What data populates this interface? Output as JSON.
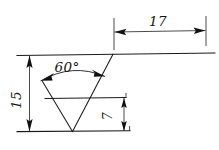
{
  "drawing": {
    "title": "Dimensioned V-groove profile sketch",
    "background_color": "#ffffff",
    "line_color": "#1a1a1a",
    "dimension_color": "#2b2b2b",
    "text_color": "#141414",
    "units_note": "",
    "dimensions": [
      {
        "id": "width-17",
        "label": "17",
        "value": 17,
        "orientation": "horizontal",
        "text_rotation_deg": 0,
        "arrow_style": "filled-inward",
        "position": "top"
      },
      {
        "id": "angle-60",
        "label": "60°",
        "value": 60,
        "orientation": "angular",
        "text_rotation_deg": 0,
        "arrow_style": "filled-arc-ends",
        "position": "inside-vee"
      },
      {
        "id": "height-15",
        "label": "15",
        "value": 15,
        "orientation": "vertical",
        "text_rotation_deg": -90,
        "arrow_style": "filled-inward",
        "position": "left"
      },
      {
        "id": "height-7",
        "label": "7",
        "value": 7,
        "orientation": "vertical",
        "text_rotation_deg": -90,
        "arrow_style": "filled-inward",
        "position": "inner-right"
      }
    ],
    "geometry": {
      "top_edge": "horizontal top surface line",
      "bottom_edge": "horizontal bottom reference line",
      "middle_edge": "horizontal line at depth 7 from bottom",
      "vee_left_arm": "left flank of V groove",
      "vee_right_arm": "right flank of V groove rising to top edge"
    }
  }
}
